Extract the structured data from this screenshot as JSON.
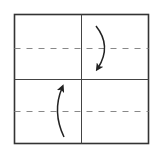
{
  "diagram": {
    "type": "fold-diagram",
    "colors": {
      "border": "#333333",
      "grid": "#444444",
      "dashed": "#888888",
      "arrow": "#222222",
      "background": "#ffffff"
    },
    "square": {
      "x": 14,
      "y": 14,
      "width": 135,
      "height": 130
    },
    "grid_lines": {
      "vertical_x": 81,
      "horizontal_y": 79
    },
    "fold_lines": [
      {
        "name": "upper-valley-fold",
        "y": 48,
        "style": "dashed"
      },
      {
        "name": "lower-valley-fold",
        "y": 111,
        "style": "dashed"
      }
    ],
    "arrows": [
      {
        "name": "fold-down-arrow",
        "direction": "down",
        "quadrant": "top-right"
      },
      {
        "name": "fold-up-arrow",
        "direction": "up",
        "quadrant": "bottom-left"
      }
    ]
  }
}
